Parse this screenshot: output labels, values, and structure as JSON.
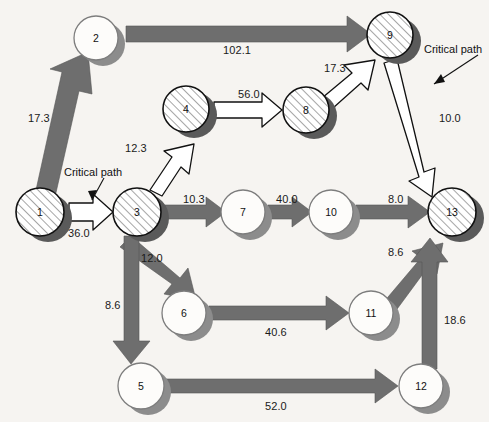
{
  "diagram": {
    "type": "activity-on-arrow network diagram",
    "background_color": "#f6f4f1",
    "arrow_gray_color": "#6e6e6e",
    "critical_arrow_color": "#ffffff",
    "node_hatch_color": "#d9d9d9",
    "node_shadow_color": "#585858",
    "nodes": [
      {
        "id": "1",
        "label": "1",
        "cx": 40,
        "cy": 212,
        "r": 24,
        "style": "hatched"
      },
      {
        "id": "2",
        "label": "2",
        "cx": 96,
        "cy": 38,
        "r": 22,
        "style": "plain"
      },
      {
        "id": "3",
        "label": "3",
        "cx": 137,
        "cy": 212,
        "r": 24,
        "style": "hatched"
      },
      {
        "id": "4",
        "label": "4",
        "cx": 186,
        "cy": 109,
        "r": 23,
        "style": "hatched"
      },
      {
        "id": "5",
        "label": "5",
        "cx": 141,
        "cy": 386,
        "r": 23,
        "style": "plain"
      },
      {
        "id": "6",
        "label": "6",
        "cx": 184,
        "cy": 313,
        "r": 22,
        "style": "plain"
      },
      {
        "id": "7",
        "label": "7",
        "cx": 243,
        "cy": 212,
        "r": 22,
        "style": "plain"
      },
      {
        "id": "8",
        "label": "8",
        "cx": 306,
        "cy": 110,
        "r": 23,
        "style": "hatched"
      },
      {
        "id": "9",
        "label": "9",
        "cx": 390,
        "cy": 35,
        "r": 23,
        "style": "hatched"
      },
      {
        "id": "10",
        "label": "10",
        "cx": 331,
        "cy": 212,
        "r": 22,
        "style": "plain"
      },
      {
        "id": "11",
        "label": "11",
        "cx": 371,
        "cy": 313,
        "r": 22,
        "style": "plain"
      },
      {
        "id": "12",
        "label": "12",
        "cx": 421,
        "cy": 386,
        "r": 22,
        "style": "plain"
      },
      {
        "id": "13",
        "label": "13",
        "cx": 452,
        "cy": 212,
        "r": 24,
        "style": "hatched"
      }
    ],
    "edges": [
      {
        "from": "1",
        "to": "2",
        "value": "17.3",
        "label_x": 28,
        "label_y": 113,
        "critical": false
      },
      {
        "from": "2",
        "to": "9",
        "value": "102.1",
        "label_x": 223,
        "label_y": 45,
        "critical": false
      },
      {
        "from": "1",
        "to": "3",
        "value": "36.0",
        "label_x": 68,
        "label_y": 228,
        "critical": true
      },
      {
        "from": "3",
        "to": "4",
        "value": "12.3",
        "label_x": 125,
        "label_y": 143,
        "critical": true
      },
      {
        "from": "4",
        "to": "8",
        "value": "56.0",
        "label_x": 238,
        "label_y": 89,
        "critical": true
      },
      {
        "from": "8",
        "to": "9",
        "value": "17.3",
        "label_x": 324,
        "label_y": 63,
        "critical": true
      },
      {
        "from": "9",
        "to": "13",
        "value": "10.0",
        "label_x": 439,
        "label_y": 113,
        "critical": true
      },
      {
        "from": "3",
        "to": "7",
        "value": "10.3",
        "label_x": 183,
        "label_y": 194,
        "critical": false
      },
      {
        "from": "7",
        "to": "10",
        "value": "40.0",
        "label_x": 276,
        "label_y": 194,
        "critical": false
      },
      {
        "from": "10",
        "to": "13",
        "value": "8.0",
        "label_x": 388,
        "label_y": 194,
        "critical": false
      },
      {
        "from": "3",
        "to": "6",
        "value": "12.0",
        "label_x": 141,
        "label_y": 253,
        "critical": false
      },
      {
        "from": "3",
        "to": "5",
        "value": "8.6",
        "label_x": 105,
        "label_y": 300,
        "critical": false
      },
      {
        "from": "6",
        "to": "11",
        "value": "40.6",
        "label_x": 265,
        "label_y": 327,
        "critical": false
      },
      {
        "from": "5",
        "to": "12",
        "value": "52.0",
        "label_x": 265,
        "label_y": 401,
        "critical": false
      },
      {
        "from": "11",
        "to": "13",
        "value": "8.6",
        "label_x": 388,
        "label_y": 247,
        "critical": false
      },
      {
        "from": "12",
        "to": "13",
        "value": "18.6",
        "label_x": 444,
        "label_y": 315,
        "critical": false
      }
    ],
    "annotations": [
      {
        "name": "critical-path-annotation-left",
        "text": "Critical path",
        "x": 64,
        "y": 167
      },
      {
        "name": "critical-path-annotation-right",
        "text": "Critical path",
        "x": 424,
        "y": 44
      }
    ]
  }
}
